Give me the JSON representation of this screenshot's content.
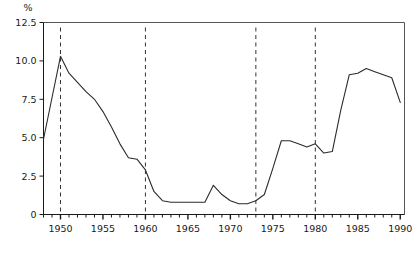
{
  "chart_data": {
    "type": "line",
    "title": "",
    "subtitle": "",
    "xlabel": "",
    "ylabel": "%",
    "unit_label": "%",
    "xlim": [
      1948,
      1990.5
    ],
    "ylim": [
      0,
      12.5
    ],
    "grid": false,
    "legend": null,
    "legend_position": "none",
    "y_ticks": [
      0,
      2.5,
      5.0,
      7.5,
      10.0,
      12.5
    ],
    "y_tick_labels": [
      "0",
      "2.5",
      "5.0",
      "7.5",
      "10.0",
      "12.5"
    ],
    "x_ticks": [
      1950,
      1955,
      1960,
      1965,
      1970,
      1975,
      1980,
      1985,
      1990
    ],
    "x_tick_labels": [
      "1950",
      "1955",
      "1960",
      "1965",
      "1970",
      "1975",
      "1980",
      "1985",
      "1990"
    ],
    "x_minor_tick_interval": 1,
    "annotations": [
      {
        "type": "vline",
        "x": 1950,
        "style": "dashed"
      },
      {
        "type": "vline",
        "x": 1960,
        "style": "dashed"
      },
      {
        "type": "vline",
        "x": 1973,
        "style": "dashed"
      },
      {
        "type": "vline",
        "x": 1980,
        "style": "dashed"
      }
    ],
    "series": [
      {
        "name": "rate",
        "color": "#2b2b2b",
        "x": [
          1948,
          1949,
          1950,
          1951,
          1952,
          1953,
          1954,
          1955,
          1956,
          1957,
          1958,
          1959,
          1960,
          1961,
          1962,
          1963,
          1964,
          1965,
          1966,
          1967,
          1968,
          1969,
          1970,
          1971,
          1972,
          1973,
          1974,
          1975,
          1976,
          1977,
          1978,
          1979,
          1980,
          1981,
          1982,
          1983,
          1984,
          1985,
          1986,
          1987,
          1988,
          1989,
          1990
        ],
        "values": [
          4.9,
          7.6,
          10.3,
          9.2,
          8.6,
          8.0,
          7.5,
          6.7,
          5.7,
          4.6,
          3.7,
          3.6,
          2.9,
          1.5,
          0.9,
          0.8,
          0.8,
          0.8,
          0.8,
          0.8,
          1.9,
          1.3,
          0.9,
          0.7,
          0.7,
          0.9,
          1.3,
          3.0,
          4.8,
          4.8,
          4.6,
          4.4,
          4.6,
          4.0,
          4.1,
          6.8,
          9.1,
          9.2,
          9.5,
          9.3,
          9.1,
          8.9,
          7.3
        ]
      }
    ]
  }
}
